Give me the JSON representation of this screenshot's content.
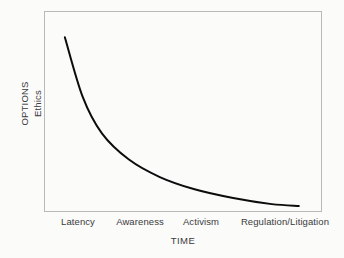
{
  "chart_data": {
    "type": "line",
    "title": "",
    "subtitle": "",
    "xlabel": "TIME",
    "ylabel": "OPTIONS",
    "ylabel_secondary": "Ethics",
    "categories": [
      "Latency",
      "Awareness",
      "Activism",
      "Regulation/Litigation"
    ],
    "x": [
      0,
      1,
      2,
      3
    ],
    "series": [
      {
        "name": "Options / Ethics",
        "values": [
          100,
          38,
          15,
          4
        ],
        "color": "#0c0c0c"
      }
    ],
    "points": [
      {
        "x": 0.12,
        "y": 100
      },
      {
        "x": 0.35,
        "y": 66
      },
      {
        "x": 0.6,
        "y": 45
      },
      {
        "x": 0.95,
        "y": 30
      },
      {
        "x": 1.35,
        "y": 20
      },
      {
        "x": 1.8,
        "y": 13
      },
      {
        "x": 2.3,
        "y": 8
      },
      {
        "x": 2.8,
        "y": 4.5
      },
      {
        "x": 3.15,
        "y": 3.5
      }
    ],
    "ylim": [
      0,
      115
    ],
    "xlim": [
      -0.15,
      3.45
    ],
    "grid": false,
    "legend": false,
    "legend_position": "none",
    "axis_ticks": false,
    "annotations": []
  },
  "axes": {
    "y": {
      "title": "OPTIONS",
      "subtitle": "Ethics"
    },
    "x": {
      "title": "TIME",
      "ticks": [
        "Latency",
        "Awareness",
        "Activism",
        "Regulation/Litigation"
      ]
    }
  },
  "colors": {
    "curve": "#0c0c0c",
    "frame": "#b9b9b9",
    "text": "#3a3a3a",
    "background": "#fbfbfa"
  }
}
